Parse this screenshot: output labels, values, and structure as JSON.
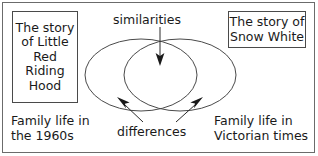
{
  "diagram": {
    "type": "venn-two-set",
    "title": "",
    "boxes": [
      {
        "id": "left-story-box",
        "lines": [
          "The story",
          "of Little",
          "Red",
          "Riding",
          "Hood"
        ]
      },
      {
        "id": "right-story-box",
        "lines": [
          "The story of",
          "Snow White"
        ]
      }
    ],
    "captions": {
      "left": [
        "Family life in",
        "the 1960s"
      ],
      "right": [
        "Family life in",
        "Victorian times"
      ]
    },
    "annotations": {
      "similarities": "similarities",
      "differences": "differences"
    },
    "colors": {
      "stroke": "#4a4a4a",
      "text": "#1a1a1a",
      "frame": "#6b6b6b",
      "background": "#ffffff"
    }
  }
}
